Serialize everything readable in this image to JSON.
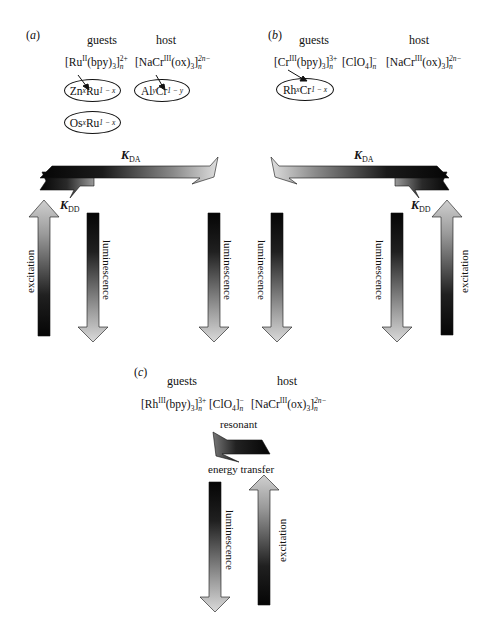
{
  "panels": {
    "a": {
      "label_letter": "a",
      "guests_heading": "guests",
      "host_heading": "host",
      "guest_formula": {
        "metal": "Ru",
        "oxidation": "II",
        "ligand": "(bpy)",
        "ligand_sub": "3",
        "charge": "2+",
        "n": "n"
      },
      "host_formula": {
        "prefix": "[NaCr",
        "oxidation": "III",
        "ligand": "(ox)",
        "ligand_sub": "3",
        "charge": "2n−",
        "n": "n"
      },
      "ellipses": [
        {
          "name": "zn-ru",
          "a": "Zn",
          "a_sub": "x",
          "b": "Ru",
          "b_sub": "1 − x"
        },
        {
          "name": "al-cr",
          "a": "Al",
          "a_sub": "y",
          "b": "Cr",
          "b_sub": "1 − y"
        },
        {
          "name": "os-ru",
          "a": "Os",
          "a_sub": "x",
          "b": "Ru",
          "b_sub": "1 − x"
        }
      ],
      "k_da": {
        "symbol": "K",
        "sub": "DA"
      },
      "k_dd": {
        "symbol": "K",
        "sub": "DD"
      },
      "excitation_label": "excitation",
      "luminescence_label_1": "luminescence",
      "luminescence_label_2": "luminescence"
    },
    "b": {
      "label_letter": "b",
      "guests_heading": "guests",
      "host_heading": "host",
      "guest_formula": {
        "metal": "Cr",
        "oxidation": "III",
        "ligand": "(bpy)",
        "ligand_sub": "3",
        "charge": "3+",
        "n": "n"
      },
      "counter_ion": {
        "text": "[ClO",
        "sub": "4",
        "charge": "−",
        "n": "n"
      },
      "host_formula": {
        "prefix": "[NaCr",
        "oxidation": "III",
        "ligand": "(ox)",
        "ligand_sub": "3",
        "charge": "2n−",
        "n": "n"
      },
      "ellipses": [
        {
          "name": "rh-cr",
          "a": "Rh",
          "a_sub": "x",
          "b": "Cr",
          "b_sub": "1 − x"
        }
      ],
      "k_da": {
        "symbol": "K",
        "sub": "DA"
      },
      "k_dd": {
        "symbol": "K",
        "sub": "DD"
      },
      "excitation_label": "excitation",
      "luminescence_label_1": "luminescence",
      "luminescence_label_2": "luminescence"
    },
    "c": {
      "label_letter": "c",
      "guests_heading": "guests",
      "host_heading": "host",
      "guest_formula": {
        "metal": "Rh",
        "oxidation": "III",
        "ligand": "(bpy)",
        "ligand_sub": "3",
        "charge": "3+",
        "n": "n"
      },
      "counter_ion": {
        "text": "[ClO",
        "sub": "4",
        "charge": "−",
        "n": "n"
      },
      "host_formula": {
        "prefix": "[NaCr",
        "oxidation": "III",
        "ligand": "(ox)",
        "ligand_sub": "3",
        "charge": "2n−",
        "n": "n"
      },
      "transfer_label_top": "resonant",
      "transfer_label_bottom": "energy transfer",
      "luminescence_label": "luminescence",
      "excitation_label": "excitation"
    }
  },
  "colors": {
    "ink": "#111111",
    "arrow_dark": "#0a0a0a",
    "arrow_light": "#d8d8d8"
  }
}
